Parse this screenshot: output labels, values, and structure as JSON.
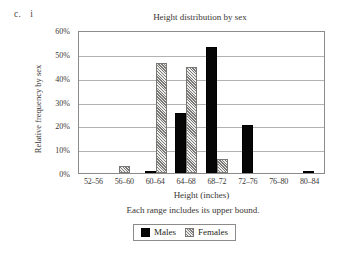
{
  "problem": {
    "part_letter": "c.",
    "sub_item": "i"
  },
  "legend": {
    "males_label": "Males",
    "females_label": "Females",
    "males_color": "#060606",
    "females_color": "#b9b7b5"
  },
  "chart_data": {
    "type": "bar",
    "title": "Height distribution by sex",
    "xlabel": "Height (inches)",
    "ylabel": "Relative frequency by sex",
    "note": "Each range includes its upper bound.",
    "categories": [
      "52–56",
      "56–60",
      "60–64",
      "64–68",
      "68–72",
      "72–76",
      "76–80",
      "80–84"
    ],
    "series": [
      {
        "name": "Males",
        "color": "#060606",
        "values": [
          0,
          0,
          1,
          25,
          53,
          20,
          0,
          1
        ]
      },
      {
        "name": "Females",
        "color": "#b9b7b5",
        "values": [
          0,
          3,
          46,
          44.5,
          6,
          0,
          0,
          0
        ]
      }
    ],
    "ylim": [
      0,
      60
    ],
    "yticks": [
      0,
      10,
      20,
      30,
      40,
      50,
      60
    ],
    "ytick_labels": [
      "0%",
      "10%",
      "20%",
      "30%",
      "40%",
      "50%",
      "60%"
    ],
    "grid": true,
    "legend_position": "bottom"
  }
}
